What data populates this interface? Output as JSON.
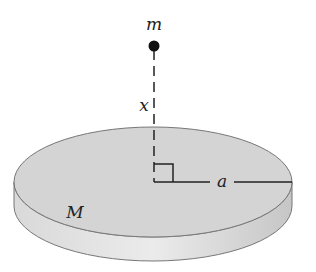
{
  "diagram": {
    "type": "physics-diagram",
    "labels": {
      "point_mass": "m",
      "distance": "x",
      "radius": "a",
      "disk_mass": "M"
    },
    "colors": {
      "disk_top": "#d3d3d3",
      "disk_side": "#e6e6e6",
      "outline": "#6e6e6e",
      "line": "#222222"
    }
  }
}
